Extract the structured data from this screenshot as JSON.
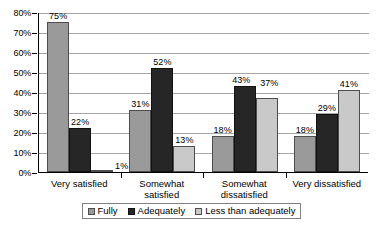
{
  "chart_data": {
    "type": "bar",
    "title": "",
    "xlabel": "",
    "ylabel": "",
    "ylim": [
      0,
      80
    ],
    "grid": true,
    "legend_position": "bottom",
    "categories": [
      "Very satisfied",
      "Somewhat satisfied",
      "Somewhat dissatisfied",
      "Very dissatisfied"
    ],
    "ytick_labels": [
      "80%",
      "70%",
      "60%",
      "50%",
      "40%",
      "30%",
      "20%",
      "10%",
      "0%"
    ],
    "ytick_values": [
      80,
      70,
      60,
      50,
      40,
      30,
      20,
      10,
      0
    ],
    "series": [
      {
        "name": "Fully",
        "color": "#9a9a9a",
        "values": [
          75,
          31,
          18,
          18
        ],
        "labels": [
          "75%",
          "31%",
          "18%",
          "18%"
        ]
      },
      {
        "name": "Adequately",
        "color": "#262626",
        "values": [
          22,
          52,
          43,
          29
        ],
        "labels": [
          "22%",
          "52%",
          "43%",
          "29%"
        ]
      },
      {
        "name": "Less than adequately",
        "color": "#c9c9c9",
        "values": [
          1,
          13,
          37,
          41
        ],
        "labels": [
          "1%",
          "13%",
          "37%",
          "41%"
        ]
      }
    ]
  },
  "axis": {
    "y_labels": [
      "80%",
      "70%",
      "60%",
      "50%",
      "40%",
      "30%",
      "20%",
      "10%",
      "0%"
    ],
    "x_labels": [
      "Very satisfied",
      "Somewhat\nsatisfied",
      "Somewhat\ndissatisfied",
      "Very dissatisfied"
    ]
  },
  "legend": {
    "items": [
      {
        "label": "Fully",
        "color": "#9a9a9a"
      },
      {
        "label": "Adequately",
        "color": "#262626"
      },
      {
        "label": "Less than adequately",
        "color": "#c9c9c9"
      }
    ]
  }
}
